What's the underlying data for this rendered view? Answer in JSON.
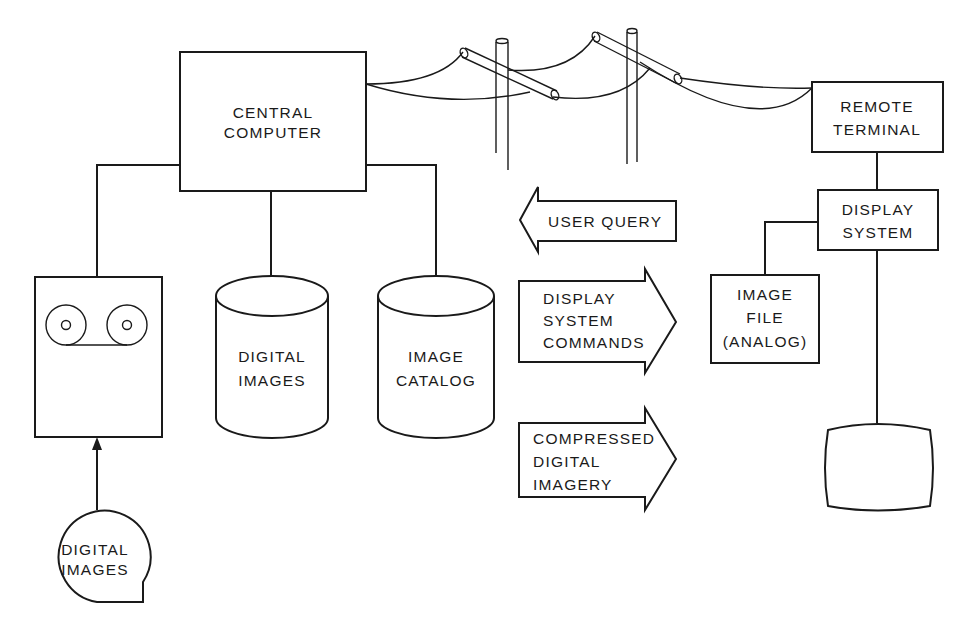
{
  "diagram": {
    "central_computer": {
      "line1": "CENTRAL",
      "line2": "COMPUTER"
    },
    "tape_drive": {
      "icon": "tape-reels-icon"
    },
    "digital_images_source": {
      "line1": "DIGITAL",
      "line2": "IMAGES"
    },
    "digital_images_store": {
      "line1": "DIGITAL",
      "line2": "IMAGES"
    },
    "image_catalog": {
      "line1": "IMAGE",
      "line2": "CATALOG"
    },
    "remote_terminal": {
      "line1": "REMOTE",
      "line2": "TERMINAL"
    },
    "display_system": {
      "line1": "DISPLAY",
      "line2": "SYSTEM"
    },
    "image_file": {
      "line1": "IMAGE",
      "line2": "FILE",
      "line3": "(ANALOG)"
    },
    "monitor": {
      "icon": "monitor-screen-icon"
    },
    "arrows": {
      "user_query": {
        "direction": "left",
        "line1": "USER QUERY"
      },
      "display_commands": {
        "direction": "right",
        "line1": "DISPLAY",
        "line2": "SYSTEM",
        "line3": "COMMANDS"
      },
      "compressed_imagery": {
        "direction": "right",
        "line1": "COMPRESSED",
        "line2": "DIGITAL",
        "line3": "IMAGERY"
      }
    },
    "telephone_link": {
      "icon": "telephone-poles-icon",
      "poles": 2
    }
  }
}
